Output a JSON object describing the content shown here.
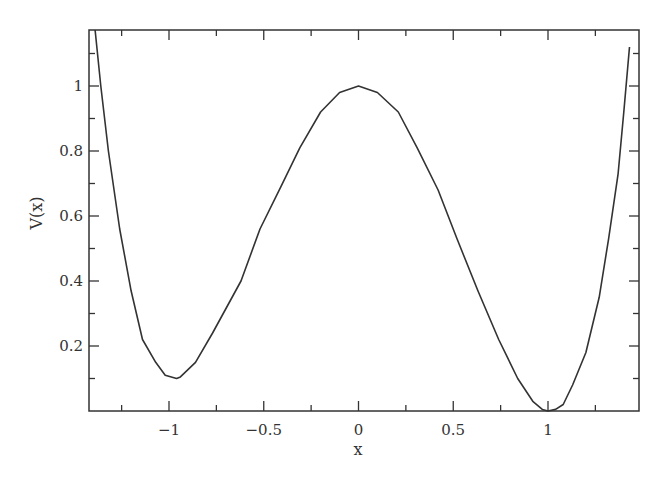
{
  "chart_data": {
    "type": "line",
    "title": "",
    "xlabel": "x",
    "ylabel": "V(x)",
    "xlim": [
      -1.42,
      1.48
    ],
    "ylim": [
      0,
      1.17
    ],
    "grid": false,
    "legend": null,
    "x_ticks": [
      -1,
      -0.5,
      0,
      0.5,
      1
    ],
    "x_tick_labels": [
      "−1",
      "−0.5",
      "0",
      "0.5",
      "1"
    ],
    "x_minor_ticks": [
      -1.25,
      -0.75,
      -0.25,
      0.25,
      0.75,
      1.25
    ],
    "y_ticks": [
      0.2,
      0.4,
      0.6,
      0.8,
      1
    ],
    "y_tick_labels": [
      "0.2",
      "0.4",
      "0.6",
      "0.8",
      "1"
    ],
    "y_minor_ticks": [
      0.1,
      0.3,
      0.5,
      0.7,
      0.9,
      1.1
    ],
    "series": [
      {
        "name": "V(x)",
        "color": "#333333",
        "x": [
          -1.39,
          -1.36,
          -1.32,
          -1.26,
          -1.2,
          -1.14,
          -1.07,
          -1.02,
          -0.96,
          -0.94,
          -0.86,
          -0.77,
          -0.62,
          -0.52,
          -0.41,
          -0.31,
          -0.2,
          -0.1,
          0.0,
          0.1,
          0.21,
          0.31,
          0.42,
          0.52,
          0.63,
          0.74,
          0.84,
          0.92,
          0.97,
          1.0,
          1.04,
          1.08,
          1.13,
          1.2,
          1.27,
          1.32,
          1.37,
          1.4,
          1.43
        ],
        "y": [
          1.18,
          1.0,
          0.8,
          0.56,
          0.37,
          0.22,
          0.15,
          0.11,
          0.1,
          0.105,
          0.15,
          0.24,
          0.4,
          0.56,
          0.69,
          0.81,
          0.92,
          0.98,
          1.0,
          0.98,
          0.92,
          0.81,
          0.68,
          0.53,
          0.37,
          0.22,
          0.1,
          0.03,
          0.005,
          0.0,
          0.005,
          0.02,
          0.08,
          0.18,
          0.35,
          0.53,
          0.73,
          0.92,
          1.12
        ]
      }
    ]
  }
}
